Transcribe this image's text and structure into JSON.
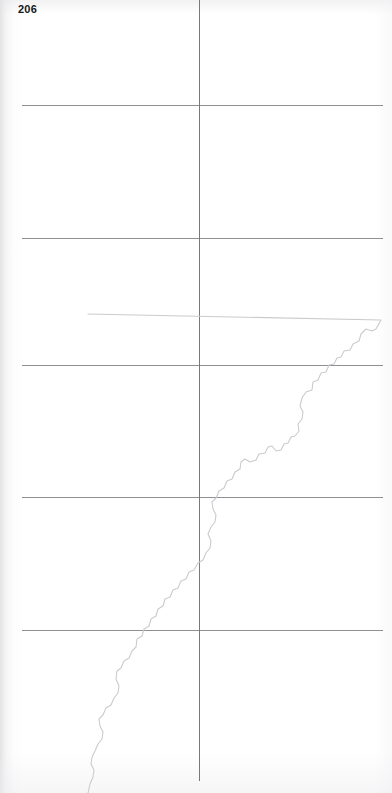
{
  "page": {
    "folio_number": "206",
    "width_px": 392,
    "height_px": 793,
    "background_color": "#ffffff",
    "medium": "scanned-atlas-page"
  },
  "map": {
    "title": "",
    "grid_line_color": "#8d8f93",
    "boundary_line_color": "#c9cbce",
    "graticule": {
      "horizontal_lines_y": [
        105,
        238,
        365,
        497,
        630
      ],
      "horizontal_extent_x": [
        22,
        383
      ],
      "vertical_lines_x": [
        199
      ],
      "vertical_extent_y": [
        0,
        781
      ],
      "spacing_px": 131
    },
    "features": [
      {
        "name": "meandering-boundary",
        "type": "polyline",
        "stroke": "#c9cbce",
        "description": "faint irregular boundary running from upper right to lower left",
        "points": "388,314 381,320 376,329 372,331 366,329 361,334 359,341 353,344 350,350 344,351 341,357 337,358 334,364 329,365 326,372 321,373 318,380 313,382 312,390 306,392 302,398 300,406 303,412 302,419 298,424 299,431 295,436 291,437 288,443 284,444 281,450 276,451 272,446 268,447 265,453 259,454 256,460 250,462 245,459 241,462 240,469 235,472 232,479 227,481 224,488 219,491 216,498 212,502 213,509 216,515 215,522 211,527 208,534 211,541 210,548 206,553 203,560 198,563 194,570 189,572 186,579 181,581 178,588 173,590 170,597 165,599 163,606 158,609 156,616 151,619 149,626 144,629 142,636 137,639 136,647 132,651 129,658 124,661 121,668 117,671 116,679 119,686 118,693 114,698 111,705 106,708 103,715 99,719 100,726 103,732 102,739 98,744 95,751 92,757 91,764 94,770 93,777 90,784 88,793"
      }
    ]
  }
}
